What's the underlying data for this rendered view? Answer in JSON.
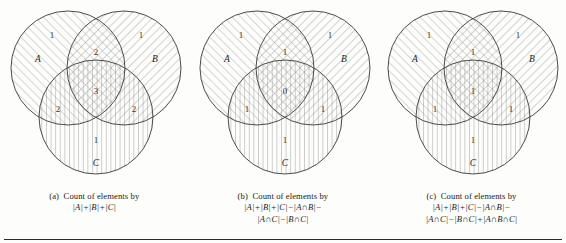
{
  "figure": {
    "background_color": "#fdfdfb",
    "stroke_color": "#4a4a4a",
    "hatch_color_a": "#9a9a9a",
    "hatch_color_b": "#8f8f8f",
    "hatch_color_c": "#8a8a8a",
    "rule_color": "#2b2b2b"
  },
  "panels": [
    {
      "id": "panel-a",
      "label": "(a)",
      "caption_line1": "Count of elements by",
      "caption_formula": "|A|+|B|+|C|",
      "set_labels": {
        "a": "A",
        "b": "B",
        "c": "C"
      },
      "counts": {
        "a_only": "1",
        "b_only": "1",
        "c_only": "1",
        "a_and_b": "2",
        "a_and_c": "2",
        "b_and_c": "2",
        "a_and_b_and_c": "3"
      }
    },
    {
      "id": "panel-b",
      "label": "(b)",
      "caption_line1": "Count of elements by",
      "caption_formula": "|A|+|B|+|C|−|A∩B|−",
      "caption_formula2": "|A∩C|−|B∩C|",
      "set_labels": {
        "a": "A",
        "b": "B",
        "c": "C"
      },
      "counts": {
        "a_only": "1",
        "b_only": "1",
        "c_only": "1",
        "a_and_b": "1",
        "a_and_c": "1",
        "b_and_c": "1",
        "a_and_b_and_c": "0"
      }
    },
    {
      "id": "panel-c",
      "label": "(c)",
      "caption_line1": "Count of elements by",
      "caption_formula": "|A|+|B|+|C|−|A∩B|−",
      "caption_formula2": "|A∩C|−|B∩C|+|A∩B∩C|",
      "set_labels": {
        "a": "A",
        "b": "B",
        "c": "C"
      },
      "counts": {
        "a_only": "1",
        "b_only": "1",
        "c_only": "1",
        "a_and_b": "1",
        "a_and_c": "1",
        "b_and_c": "1",
        "a_and_b_and_c": "1"
      }
    }
  ]
}
